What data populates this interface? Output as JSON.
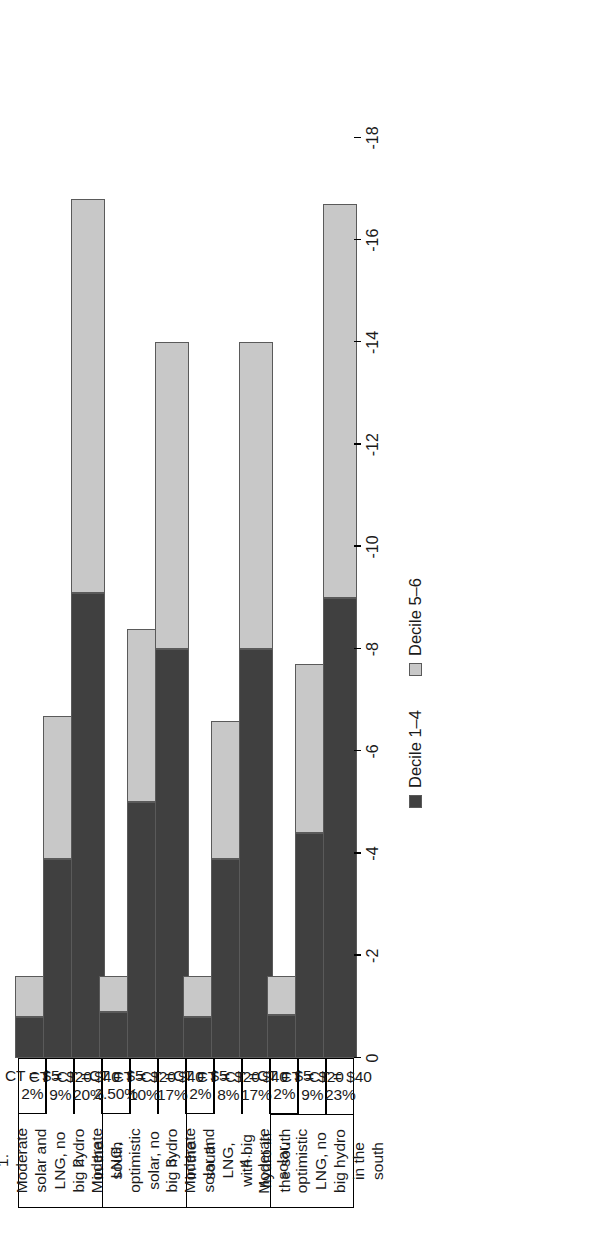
{
  "chart_data": {
    "type": "bar",
    "orientation": "horizontal-stacked",
    "title": "",
    "xlabel": "",
    "ylabel": "",
    "xlim": [
      0,
      -18
    ],
    "grid": false,
    "legend_position": "bottom-center",
    "tick_labels": [
      "0",
      "-2",
      "-4",
      "-6",
      "-8",
      "-10",
      "-12",
      "-14",
      "-16",
      "-18"
    ],
    "tick_values": [
      0,
      -2,
      -4,
      -6,
      -8,
      -10,
      -12,
      -14,
      -16,
      -18
    ],
    "series": [
      {
        "name": "Decile 1–4",
        "color": "#404040"
      },
      {
        "name": "Decile 5–6",
        "color": "#c8c8c8"
      }
    ],
    "groups": [
      {
        "title": "1. Moderate solar and LNG, no big hydro in the south",
        "categories": [
          {
            "carbon_tax": "CT = $5",
            "percent": "2%",
            "values": [
              -0.8,
              -0.8
            ]
          },
          {
            "carbon_tax": "CT = $20",
            "percent": "9%",
            "values": [
              -3.9,
              -2.8
            ]
          },
          {
            "carbon_tax": "CT = $40",
            "percent": "20%",
            "values": [
              -9.1,
              -7.7
            ]
          }
        ]
      },
      {
        "title": "2. Moderate LNG, optimistic solar, no big hydro in the south",
        "categories": [
          {
            "carbon_tax": "CT = $5",
            "percent": "2.50%",
            "values": [
              -0.9,
              -0.7
            ]
          },
          {
            "carbon_tax": "CT = $20",
            "percent": "10%",
            "values": [
              -5.0,
              -3.4
            ]
          },
          {
            "carbon_tax": "CT = $40",
            "percent": "17%",
            "values": [
              -8.0,
              -6.0
            ]
          }
        ]
      },
      {
        "title": "3. Moderate solar and LNG, with big hydro in the south",
        "categories": [
          {
            "carbon_tax": "CT = $5",
            "percent": "2%",
            "values": [
              -0.8,
              -0.8
            ]
          },
          {
            "carbon_tax": "CT = $20",
            "percent": "8%",
            "values": [
              -3.9,
              -2.7
            ]
          },
          {
            "carbon_tax": "CT = $40",
            "percent": "17%",
            "values": [
              -8.0,
              -6.0
            ]
          }
        ]
      },
      {
        "title": "4. Moderate solar, optimistic LNG, no big hydro in the south",
        "categories": [
          {
            "carbon_tax": "CT = $5",
            "percent": "2%",
            "values": [
              -0.85,
              -0.75
            ]
          },
          {
            "carbon_tax": "CT = $20",
            "percent": "9%",
            "values": [
              -4.4,
              -3.3
            ]
          },
          {
            "carbon_tax": "CT = $40",
            "percent": "23%",
            "values": [
              -9.0,
              -7.7
            ]
          }
        ]
      }
    ]
  }
}
